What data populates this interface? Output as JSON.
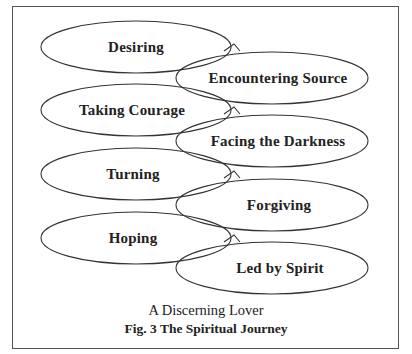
{
  "diagram": {
    "left_stages": [
      {
        "label": "Desiring",
        "cx": 136,
        "cy": 47
      },
      {
        "label": "Taking Courage",
        "cx": 136,
        "cy": 110
      },
      {
        "label": "Turning",
        "cx": 136,
        "cy": 174
      },
      {
        "label": "Hoping",
        "cx": 136,
        "cy": 238
      }
    ],
    "right_stages": [
      {
        "label": "Encountering Source",
        "cx": 272,
        "cy": 78
      },
      {
        "label": "Facing the Darkness",
        "cx": 272,
        "cy": 141
      },
      {
        "label": "Forgiving",
        "cx": 272,
        "cy": 205
      },
      {
        "label": "Led by Spirit",
        "cx": 272,
        "cy": 268
      }
    ]
  },
  "caption": {
    "subtitle": "A Discerning Lover",
    "title": "Fig. 3 The Spiritual Journey"
  }
}
